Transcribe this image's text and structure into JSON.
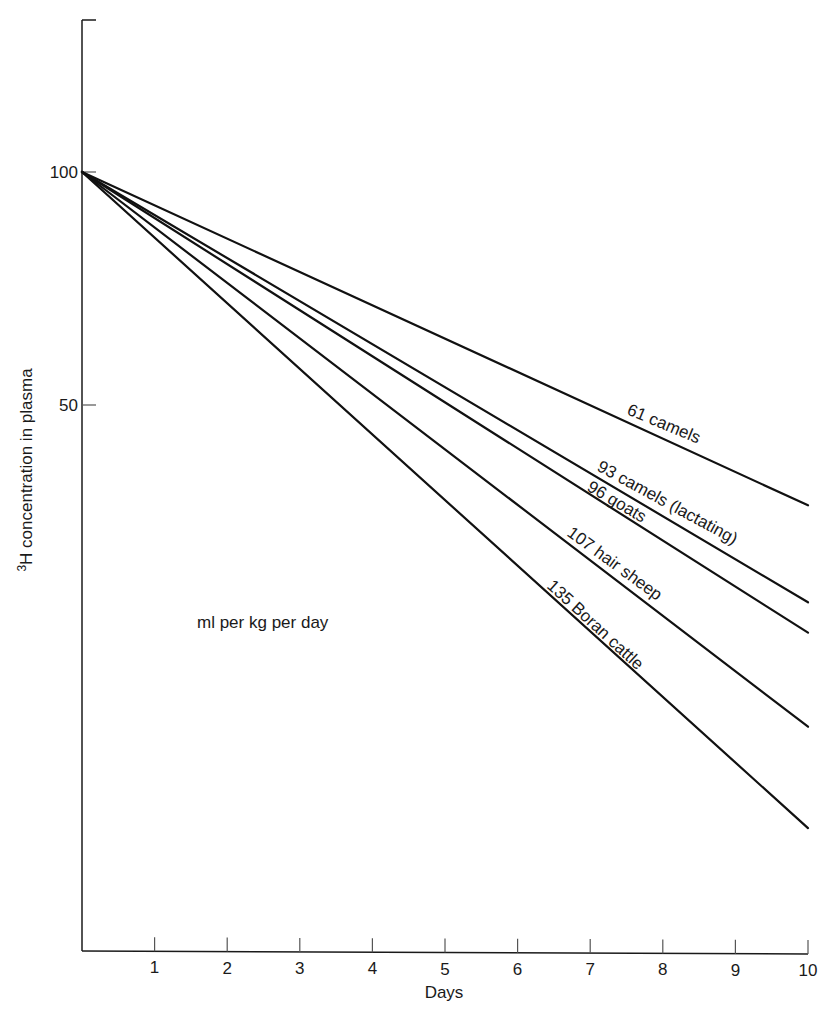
{
  "chart_data": {
    "type": "line",
    "title": "",
    "xlabel": "Days",
    "ylabel": "3H concentration in plasma",
    "ylabel_superscript": "3",
    "ylabel_rest": "H concentration in plasma",
    "yscale": "log",
    "x_ticks": [
      1,
      2,
      3,
      4,
      5,
      6,
      7,
      8,
      9,
      10
    ],
    "y_ticks": [
      100,
      50
    ],
    "xlim": [
      0,
      10
    ],
    "ylim": [
      9.8,
      157
    ],
    "grid": false,
    "annotation": "ml per kg per day",
    "x": [
      0,
      10
    ],
    "series": [
      {
        "name": "61 camels",
        "label": "61 camels",
        "values": [
          100,
          37.1
        ]
      },
      {
        "name": "93 camels (lactating)",
        "label": "93 camels (lactating)",
        "values": [
          100,
          27.8
        ]
      },
      {
        "name": "96 goats",
        "label": "96 goats",
        "values": [
          100,
          25.4
        ]
      },
      {
        "name": "107 hair sheep",
        "label": "107 hair sheep",
        "values": [
          100,
          19.2
        ]
      },
      {
        "name": "135 Boran cattle",
        "label": "135 Boran cattle",
        "values": [
          100,
          14.2
        ]
      }
    ]
  },
  "labels": {
    "x_tick_labels": [
      "1",
      "2",
      "3",
      "4",
      "5",
      "6",
      "7",
      "8",
      "9",
      "10"
    ],
    "y_tick_100": "100",
    "y_tick_50": "50",
    "xlabel": "Days",
    "ylabel_sup": "3",
    "ylabel_rest": "H concentration in plasma",
    "note": "ml per kg per day",
    "series_labels": [
      "61 camels",
      "93 camels (lactating)",
      "96 goats",
      "107 hair sheep",
      "135 Boran cattle"
    ]
  }
}
